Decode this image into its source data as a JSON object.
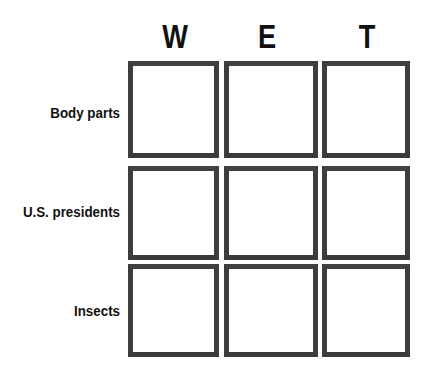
{
  "board": {
    "title": "Category grid",
    "columns": [
      {
        "label": "W"
      },
      {
        "label": "E"
      },
      {
        "label": "T"
      }
    ],
    "rows": [
      {
        "label": "Body parts"
      },
      {
        "label": "U.S. presidents"
      },
      {
        "label": "Insects"
      }
    ],
    "cells": [
      [
        {
          "value": ""
        },
        {
          "value": ""
        },
        {
          "value": ""
        }
      ],
      [
        {
          "value": ""
        },
        {
          "value": ""
        },
        {
          "value": ""
        }
      ],
      [
        {
          "value": ""
        },
        {
          "value": ""
        },
        {
          "value": ""
        }
      ]
    ],
    "colors": {
      "background": "#ffffff",
      "cell_fill": "#ffffff",
      "cell_border": "#3b3b3b",
      "text": "#111111"
    }
  }
}
